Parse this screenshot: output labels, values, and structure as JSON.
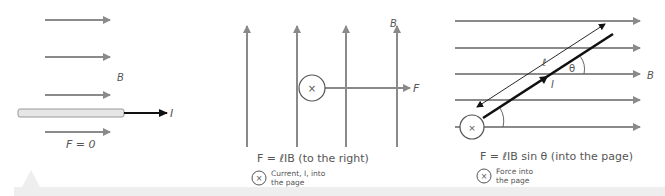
{
  "colors": {
    "field_line": "#8a8a8a",
    "wire_fill": "#e6e6e6",
    "wire_stroke": "#999999",
    "current": "#111111",
    "text": "#555555",
    "strip": "#eeeeee"
  },
  "panel1": {
    "field_label": "B",
    "current_label": "I",
    "force_label": "F = 0"
  },
  "panel2": {
    "field_label": "B",
    "force_arrow_label": "F",
    "equation": "F = ℓIB  (to the right)",
    "legend_symbol": "×",
    "legend_line1": "Current, I, into",
    "legend_line2": "the page"
  },
  "panel3": {
    "length_label": "ℓ",
    "angle_label": "θ",
    "current_label": "I",
    "field_label": "B",
    "equation": "F = ℓIB sin θ (into the page)",
    "legend_symbol": "×",
    "legend_line1": "Force into",
    "legend_line2": "the page"
  }
}
